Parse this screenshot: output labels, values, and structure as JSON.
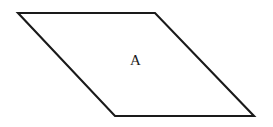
{
  "figure": {
    "kind": "geometry-diagram",
    "canvas": {
      "width": 273,
      "height": 127,
      "background_color": "#ffffff"
    },
    "shape": {
      "name": "parallelogram",
      "stroke_color": "#1a1a1a",
      "fill_color": "#ffffff",
      "stroke_width": 2.1,
      "points": "18,13 155,13 254,116 115,116",
      "vertices": [
        {
          "name": "top-left",
          "x": 18,
          "y": 13
        },
        {
          "name": "top-right",
          "x": 155,
          "y": 13
        },
        {
          "name": "bottom-right",
          "x": 254,
          "y": 116
        },
        {
          "name": "bottom-left",
          "x": 115,
          "y": 116
        }
      ]
    },
    "labels": [
      {
        "id": "region-a",
        "text": "A",
        "x": 130,
        "y": 53,
        "color": "#1a1a1a",
        "font_size_px": 15
      }
    ]
  }
}
